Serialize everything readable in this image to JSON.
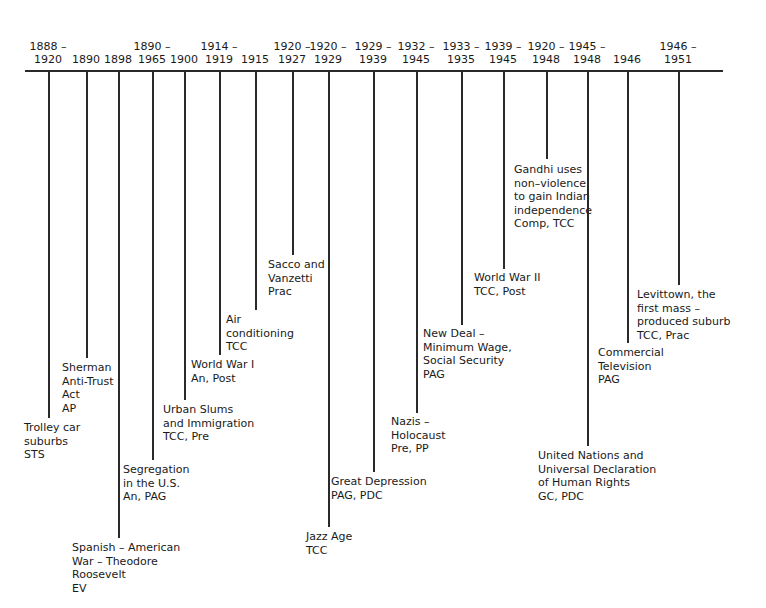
{
  "timeline": {
    "events": [
      {
        "years": "1888 –\n1920",
        "label": "Trolley car\nsuburbs\nSTS",
        "x": 48,
        "stem_end": 418,
        "label_x": 24,
        "label_y": 421
      },
      {
        "years": "1890",
        "label": "Sherman\nAnti-Trust\nAct\nAP",
        "x": 86,
        "stem_end": 358,
        "label_x": 62,
        "label_y": 361
      },
      {
        "years": "1898",
        "label": "Spanish – American\nWar – Theodore\nRoosevelt\nEV",
        "x": 118,
        "stem_end": 538,
        "label_x": 72,
        "label_y": 541
      },
      {
        "years": "1890 –\n1965",
        "label": "Segregation\nin the U.S.\nAn, PAG",
        "x": 152,
        "stem_end": 460,
        "label_x": 123,
        "label_y": 463
      },
      {
        "years": "1900",
        "label": "Urban Slums\nand Immigration\nTCC, Pre",
        "x": 184,
        "stem_end": 400,
        "label_x": 163,
        "label_y": 403
      },
      {
        "years": "1914 –\n1919",
        "label": "World War I\nAn, Post",
        "x": 219,
        "stem_end": 355,
        "label_x": 191,
        "label_y": 358
      },
      {
        "years": "1915",
        "label": "Air\nconditioning\nTCC",
        "x": 255,
        "stem_end": 310,
        "label_x": 226,
        "label_y": 313
      },
      {
        "years": "1920 –\n1927",
        "label": "Sacco and\nVanzetti\nPrac",
        "x": 292,
        "stem_end": 255,
        "label_x": 268,
        "label_y": 258
      },
      {
        "years": "1920 –\n1929",
        "label": "Jazz Age\nTCC",
        "x": 328,
        "stem_end": 527,
        "label_x": 306,
        "label_y": 530
      },
      {
        "years": "1929 –\n1939",
        "label": "Great Depression\nPAG, PDC",
        "x": 373,
        "stem_end": 472,
        "label_x": 331,
        "label_y": 475
      },
      {
        "years": "1932 –\n1945",
        "label": "Nazis –\nHolocaust\nPre, PP",
        "x": 416,
        "stem_end": 413,
        "label_x": 391,
        "label_y": 415
      },
      {
        "years": "1933 –\n1935",
        "label": "New Deal –\nMinimum Wage,\nSocial Security\nPAG",
        "x": 461,
        "stem_end": 325,
        "label_x": 423,
        "label_y": 327
      },
      {
        "years": "1939 –\n1945",
        "label": "World War II\nTCC, Post",
        "x": 503,
        "stem_end": 269,
        "label_x": 474,
        "label_y": 271
      },
      {
        "years": "1920 –\n1948",
        "label": "Gandhi uses\nnon–violence\nto gain Indian\nindependence\nComp, TCC",
        "x": 546,
        "stem_end": 159,
        "label_x": 514,
        "label_y": 163
      },
      {
        "years": "1945 –\n1948",
        "label": "United Nations and\nUniversal Declaration\nof Human Rights\nGC, PDC",
        "x": 587,
        "stem_end": 446,
        "label_x": 538,
        "label_y": 449
      },
      {
        "years": "1946",
        "label": "Commercial\nTelevision\nPAG",
        "x": 627,
        "stem_end": 343,
        "label_x": 598,
        "label_y": 346
      },
      {
        "years": "1946 –\n1951",
        "label": "Levittown, the\nfirst mass –\nproduced suburb\nTCC, Prac",
        "x": 678,
        "stem_end": 285,
        "label_x": 637,
        "label_y": 288
      }
    ]
  }
}
